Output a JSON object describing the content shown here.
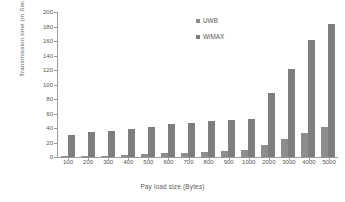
{
  "chart_data": {
    "type": "bar",
    "title": "",
    "xlabel": "Pay load size (Bytes)",
    "ylabel": "Transmission  time (m Sec)",
    "categories": [
      "100",
      "200",
      "300",
      "400",
      "500",
      "600",
      "700",
      "800",
      "900",
      "1000",
      "2000",
      "3000",
      "4000",
      "5000"
    ],
    "series": [
      {
        "name": "UWB",
        "color": "#8d8d8d",
        "values": [
          1,
          1.5,
          2,
          3,
          4,
          5,
          6,
          7,
          8,
          9,
          17,
          25,
          33,
          41
        ]
      },
      {
        "name": "WiMAX",
        "color": "#7e7e7e",
        "values": [
          31,
          34,
          36,
          39,
          42,
          45,
          47,
          49,
          51,
          53,
          88,
          121,
          162,
          184
        ]
      }
    ],
    "ylim": [
      0,
      200
    ],
    "yticks": [
      0,
      20,
      40,
      60,
      80,
      100,
      120,
      140,
      160,
      180,
      200
    ],
    "grid": false,
    "legend_position": "inside-top-center",
    "axis_color": "#9a9a9a",
    "background": "#ffffff"
  }
}
